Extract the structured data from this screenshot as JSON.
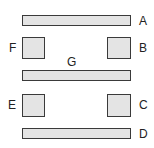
{
  "diagram": {
    "colors": {
      "fill": "#e4e4e4",
      "stroke": "#3a3a3a",
      "text": "#222222"
    },
    "shapes": [
      {
        "id": "A",
        "type": "bar",
        "x": 22,
        "y": 15,
        "w": 109,
        "h": 11
      },
      {
        "id": "F",
        "type": "square",
        "x": 22,
        "y": 37,
        "w": 23,
        "h": 22
      },
      {
        "id": "B",
        "type": "square",
        "x": 107,
        "y": 37,
        "w": 24,
        "h": 22
      },
      {
        "id": "G",
        "type": "bar",
        "x": 22,
        "y": 70,
        "w": 109,
        "h": 11
      },
      {
        "id": "E",
        "type": "square",
        "x": 22,
        "y": 94,
        "w": 23,
        "h": 23
      },
      {
        "id": "C",
        "type": "square",
        "x": 107,
        "y": 94,
        "w": 24,
        "h": 23
      },
      {
        "id": "D",
        "type": "bar",
        "x": 22,
        "y": 128,
        "w": 109,
        "h": 11
      }
    ],
    "labels": {
      "A": "A",
      "B": "B",
      "C": "C",
      "D": "D",
      "E": "E",
      "F": "F",
      "G": "G"
    }
  }
}
